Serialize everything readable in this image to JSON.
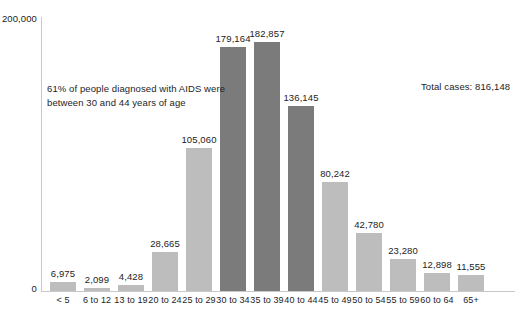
{
  "chart_data": {
    "type": "bar",
    "title": "",
    "xlabel": "",
    "ylabel": "",
    "ylim": [
      0,
      200000
    ],
    "grid": false,
    "legend": "none",
    "categories": [
      "< 5",
      "6 to 12",
      "13 to 19",
      "20 to 24",
      "25 to 29",
      "30 to 34",
      "35 to 39",
      "40 to 44",
      "45 to 49",
      "50 to 54",
      "55 to 59",
      "60 to 64",
      "65+"
    ],
    "values": [
      6975,
      2099,
      4428,
      28665,
      105060,
      179164,
      182857,
      136145,
      80242,
      42780,
      23280,
      12898,
      11555
    ],
    "value_labels": [
      "6,975",
      "2,099",
      "4,428",
      "28,665",
      "105,060",
      "179,164",
      "182,857",
      "136,145",
      "80,242",
      "42,780",
      "23,280",
      "12,898",
      "11,555"
    ],
    "highlighted": [
      false,
      false,
      false,
      false,
      false,
      true,
      true,
      true,
      false,
      false,
      false,
      false,
      false
    ],
    "ytick_labels": [
      "200,000",
      "0"
    ],
    "ytick_values": [
      200000,
      0
    ],
    "annotations": [
      "61% of people diagnosed with AIDS were between 30 and 44 years of age",
      "Total cases: 816,148"
    ],
    "colors": {
      "bar": "#bdbdbd",
      "bar_highlight": "#7b7b7b",
      "text": "#1d1d1d",
      "axis": "#c9c9c9",
      "background": "#ffffff"
    }
  },
  "axis": {
    "y_top_label": "200,000",
    "y_zero_label": "0"
  },
  "notes": {
    "annotation_line1": "61% of people diagnosed with AIDS were",
    "annotation_line2": "between 30 and 44 years of age",
    "total_cases": "Total cases: 816,148"
  }
}
